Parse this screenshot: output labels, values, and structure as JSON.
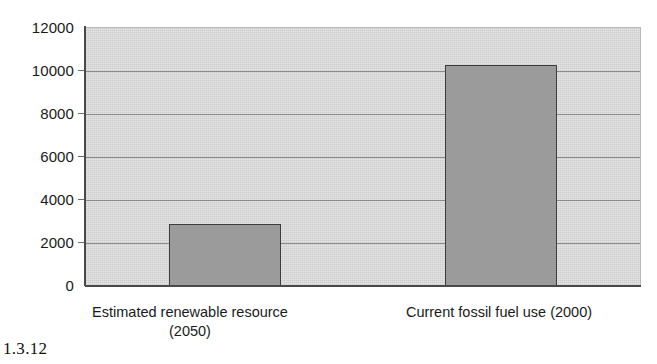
{
  "caption": "1.3.12",
  "chart_data": {
    "type": "bar",
    "title": "",
    "subtitle": "",
    "xlabel": "",
    "ylabel": "",
    "categories": [
      "Estimated renewable resource (2050)",
      "Current fossil fuel use (2000)"
    ],
    "category_lines": [
      [
        "Estimated renewable resource",
        "(2050)"
      ],
      [
        "Current fossil fuel use (2000)",
        ""
      ]
    ],
    "values": [
      2900,
      10300
    ],
    "ylim": [
      0,
      12000
    ],
    "ytick_step": 2000,
    "ytick_labels": [
      "12000",
      "10000",
      "8000",
      "6000",
      "4000",
      "2000",
      "0"
    ],
    "ytick_values": [
      12000,
      10000,
      8000,
      6000,
      4000,
      2000,
      0
    ],
    "grid": true,
    "grid_axis": "y",
    "legend": false,
    "legend_position": "none",
    "colors": {
      "bar_fill": "#9b9b9b",
      "bar_border": "#3d3d3d",
      "plot_background": "#d5d5d5",
      "gridline": "#7d7d7d",
      "axis": "#4a4a4a",
      "text": "#1a1a1a",
      "page_background": "#ffffff"
    }
  }
}
